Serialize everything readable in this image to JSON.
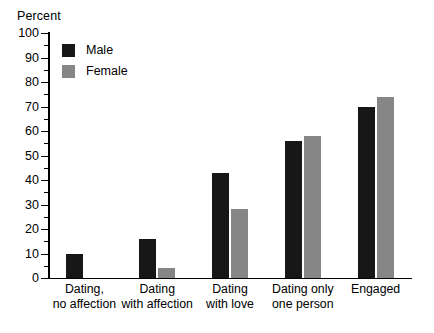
{
  "chart_data": {
    "type": "bar",
    "title": "",
    "subtitle": "",
    "xlabel": "",
    "ylabel": "Percent",
    "ylim": [
      0,
      100
    ],
    "ytick_step": 10,
    "yminor_step": 5,
    "grid": false,
    "legend_position": "top-left",
    "categories": [
      "Dating,\nno affection",
      "Dating\nwith affection",
      "Dating\nwith love",
      "Dating only\none person",
      "Engaged"
    ],
    "ytick_labels": [
      "0",
      "10",
      "20",
      "30",
      "40",
      "50",
      "60",
      "70",
      "80",
      "90",
      "100"
    ],
    "series": [
      {
        "name": "Male",
        "color": "#171717",
        "values": [
          10,
          16,
          43,
          56,
          70
        ]
      },
      {
        "name": "Female",
        "color": "#868686",
        "values": [
          0,
          4,
          28,
          58,
          74
        ]
      }
    ]
  },
  "legend": {
    "items": [
      {
        "label": "Male",
        "color": "#171717"
      },
      {
        "label": "Female",
        "color": "#868686"
      }
    ]
  }
}
